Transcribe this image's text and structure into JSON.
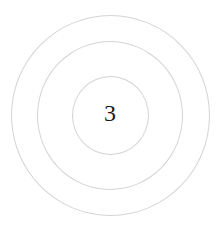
{
  "diagram": {
    "type": "concentric-circles",
    "ring_count": 3,
    "center_label": "3",
    "ring_color": "#d4d4d4",
    "label_color": "#1a1a1a",
    "rings": [
      {
        "name": "outer"
      },
      {
        "name": "middle"
      },
      {
        "name": "inner"
      }
    ]
  }
}
